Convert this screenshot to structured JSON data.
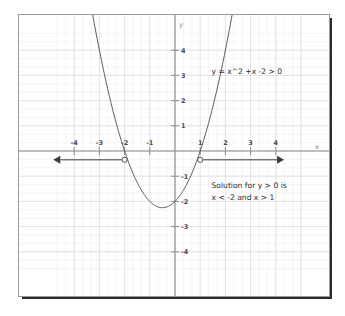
{
  "chart_data": {
    "type": "line",
    "title": "",
    "xlabel": "x",
    "ylabel": "y",
    "xlim": [
      -4.95,
      5.2
    ],
    "ylim": [
      -4.8,
      4.9
    ],
    "grid": true,
    "minor_grid_step": 0.3333,
    "major_grid_step": 1,
    "legend_position": "none",
    "x_ticks": [
      -4,
      -3,
      -2,
      -1,
      1,
      2,
      3,
      4
    ],
    "x_tick_labels": [
      "-4",
      "-3",
      "-2",
      "-1",
      "1",
      "2",
      "3",
      "4"
    ],
    "y_ticks": [
      4,
      3,
      2,
      1,
      -1,
      -2,
      -3,
      -4
    ],
    "y_tick_labels": [
      "4",
      "3",
      "2",
      "1",
      "-1",
      "-2",
      "-3",
      "-4"
    ],
    "series": [
      {
        "name": "y = x^2 + x - 2",
        "type": "parabola",
        "equation_a": 1,
        "equation_b": 1,
        "equation_c": -2,
        "vertex": [
          -0.5,
          -2.25
        ],
        "roots": [
          -2,
          1
        ],
        "color": "#4a4a4a"
      }
    ],
    "annotations": [
      {
        "name": "equation-label",
        "text": "y = x^2 +x -2 > 0",
        "x": 1.45,
        "y": 3.05
      },
      {
        "name": "solution-line-1",
        "text": "Solution for y > 0 is",
        "x": 1.45,
        "y": -1.45
      },
      {
        "name": "solution-line-2",
        "text": "x < -2 and x > 1",
        "x": 1.45,
        "y": -1.95
      }
    ],
    "solution_rays": [
      {
        "name": "left-ray",
        "open_circle_at": -2,
        "direction": "left",
        "arrow_end_x": -4.55,
        "y_level": -0.35
      },
      {
        "name": "right-ray",
        "open_circle_at": 1,
        "direction": "right",
        "arrow_end_x": 4.05,
        "y_level": -0.35
      }
    ]
  },
  "axes": {
    "x_axis_label": "x",
    "y_axis_label": "y"
  },
  "ticks": {
    "x": [
      "-4",
      "-3",
      "-2",
      "-1",
      "1",
      "2",
      "3",
      "4"
    ],
    "y": [
      "4",
      "3",
      "2",
      "1",
      "-1",
      "-2",
      "-3",
      "-4"
    ]
  },
  "annotations": {
    "equation": "y = x^2 +x -2 > 0",
    "solution_line_1": "Solution for y > 0 is",
    "solution_line_2": "x < -2 and x > 1"
  },
  "colors": {
    "background": "#ffffff",
    "grid_minor": "#ededf0",
    "grid_major": "#dcdce2",
    "axis": "#8d8d8d",
    "curve": "#4a4a4a",
    "ray": "#3a3a3a",
    "text": "#2f2f2f",
    "frame": "#9a9a9a",
    "frame_shadow": "#2b2b2b"
  }
}
